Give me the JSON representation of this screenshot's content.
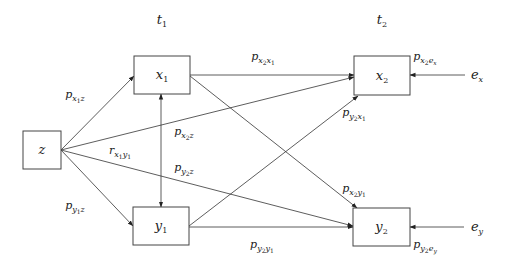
{
  "diagram": {
    "type": "path-diagram",
    "time_labels": [
      {
        "id": "t1",
        "base": "t",
        "sub": "1",
        "x": 162,
        "y": 24
      },
      {
        "id": "t2",
        "base": "t",
        "sub": "2",
        "x": 382,
        "y": 24
      }
    ],
    "nodes": [
      {
        "id": "z",
        "base": "z",
        "sub": "",
        "x": 23,
        "y": 131,
        "w": 38,
        "h": 38
      },
      {
        "id": "x1",
        "base": "x",
        "sub": "1",
        "x": 134,
        "y": 56,
        "w": 56,
        "h": 38
      },
      {
        "id": "y1",
        "base": "y",
        "sub": "1",
        "x": 133,
        "y": 207,
        "w": 56,
        "h": 38
      },
      {
        "id": "x2",
        "base": "x",
        "sub": "2",
        "x": 354,
        "y": 56,
        "w": 56,
        "h": 39
      },
      {
        "id": "y2",
        "base": "y",
        "sub": "2",
        "x": 353,
        "y": 208,
        "w": 57,
        "h": 38
      }
    ],
    "error_terms": [
      {
        "id": "ex",
        "base": "e",
        "sub": "x",
        "x": 477,
        "y": 79
      },
      {
        "id": "ey",
        "base": "e",
        "sub": "y",
        "x": 477,
        "y": 231
      }
    ],
    "edges": [
      {
        "from": "z",
        "to": "x1",
        "x1": 61,
        "y1": 150,
        "x2": 134,
        "y2": 76,
        "type": "directed"
      },
      {
        "from": "z",
        "to": "y1",
        "x1": 61,
        "y1": 150,
        "x2": 133,
        "y2": 226,
        "type": "directed"
      },
      {
        "from": "z",
        "to": "x2",
        "x1": 61,
        "y1": 150,
        "x2": 354,
        "y2": 77,
        "type": "directed"
      },
      {
        "from": "z",
        "to": "y2",
        "x1": 61,
        "y1": 150,
        "x2": 353,
        "y2": 226,
        "type": "directed"
      },
      {
        "from": "x1",
        "to": "x2",
        "x1": 190,
        "y1": 75,
        "x2": 354,
        "y2": 75,
        "type": "directed"
      },
      {
        "from": "x1",
        "to": "y2",
        "x1": 190,
        "y1": 76,
        "x2": 357,
        "y2": 208,
        "type": "directed"
      },
      {
        "from": "y1",
        "to": "x2",
        "x1": 189,
        "y1": 226,
        "x2": 358,
        "y2": 96,
        "type": "directed"
      },
      {
        "from": "y1",
        "to": "y2",
        "x1": 189,
        "y1": 227,
        "x2": 353,
        "y2": 227,
        "type": "directed"
      },
      {
        "from": "x1",
        "to": "y1",
        "x1": 161,
        "y1": 94,
        "x2": 161,
        "y2": 207,
        "type": "bidirectional"
      },
      {
        "from": "ex",
        "to": "x2",
        "x1": 465,
        "y1": 75,
        "x2": 410,
        "y2": 75,
        "type": "directed"
      },
      {
        "from": "ey",
        "to": "y2",
        "x1": 464,
        "y1": 227,
        "x2": 410,
        "y2": 227,
        "type": "directed"
      }
    ],
    "path_labels": [
      {
        "id": "p_x1z",
        "text": "p",
        "sub1": "x",
        "sub2": "1",
        "sub3": "z",
        "x": 75,
        "y": 98
      },
      {
        "id": "p_y1z",
        "text": "p",
        "sub1": "y",
        "sub2": "1",
        "sub3": "z",
        "x": 75,
        "y": 209
      },
      {
        "id": "r_x1y1",
        "text": "r",
        "sub1": "x",
        "sub2": "1",
        "sub3": "y",
        "sub4": "1",
        "x": 120,
        "y": 154
      },
      {
        "id": "p_x2z",
        "text": "p",
        "sub1": "x",
        "sub2": "2",
        "sub3": "z",
        "x": 184,
        "y": 135
      },
      {
        "id": "p_y2z",
        "text": "p",
        "sub1": "y",
        "sub2": "2",
        "sub3": "z",
        "x": 184,
        "y": 171
      },
      {
        "id": "p_x2x1",
        "text": "p",
        "sub1": "x",
        "sub2": "2",
        "sub3": "x",
        "sub4": "1",
        "x": 263,
        "y": 60
      },
      {
        "id": "p_y2x1",
        "text": "p",
        "sub1": "y",
        "sub2": "2",
        "sub3": "x",
        "sub4": "1",
        "x": 354,
        "y": 116
      },
      {
        "id": "p_x2y1",
        "text": "p",
        "sub1": "x",
        "sub2": "2",
        "sub3": "y",
        "sub4": "1",
        "x": 354,
        "y": 192
      },
      {
        "id": "p_y2y1",
        "text": "p",
        "sub1": "y",
        "sub2": "2",
        "sub3": "y",
        "sub4": "1",
        "x": 262,
        "y": 248
      },
      {
        "id": "p_x2ex",
        "text": "p",
        "sub1": "x",
        "sub2": "2",
        "sub3": "e",
        "sub4": "x",
        "x": 425,
        "y": 60
      },
      {
        "id": "p_y2ey",
        "text": "p",
        "sub1": "y",
        "sub2": "2",
        "sub3": "e",
        "sub4": "y",
        "x": 425,
        "y": 248
      }
    ]
  }
}
